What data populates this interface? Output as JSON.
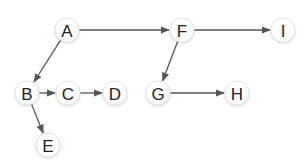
{
  "diagram": {
    "type": "tree",
    "colors": {
      "background": "#ffffff",
      "node_fill": "#ffffff",
      "node_border": "#e2e2e2",
      "edge": "#555555",
      "label": "#222222"
    },
    "nodes": [
      {
        "id": "A",
        "label": "A",
        "x": 67,
        "y": 30
      },
      {
        "id": "F",
        "label": "F",
        "x": 182,
        "y": 30
      },
      {
        "id": "I",
        "label": "I",
        "x": 283,
        "y": 30
      },
      {
        "id": "B",
        "label": "B",
        "x": 27,
        "y": 93
      },
      {
        "id": "C",
        "label": "C",
        "x": 68,
        "y": 93
      },
      {
        "id": "D",
        "label": "D",
        "x": 115,
        "y": 93
      },
      {
        "id": "G",
        "label": "G",
        "x": 158,
        "y": 93
      },
      {
        "id": "H",
        "label": "H",
        "x": 237,
        "y": 93
      },
      {
        "id": "E",
        "label": "E",
        "x": 48,
        "y": 145
      }
    ],
    "edges": [
      {
        "from": "A",
        "to": "F"
      },
      {
        "from": "A",
        "to": "B"
      },
      {
        "from": "F",
        "to": "I"
      },
      {
        "from": "F",
        "to": "G"
      },
      {
        "from": "B",
        "to": "C"
      },
      {
        "from": "B",
        "to": "E"
      },
      {
        "from": "C",
        "to": "D"
      },
      {
        "from": "G",
        "to": "H"
      }
    ]
  }
}
